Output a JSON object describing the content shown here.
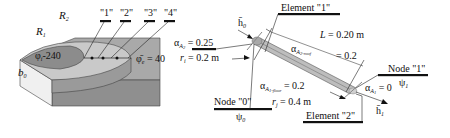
{
  "left_panel": {
    "labels": {
      "R1": "R",
      "R1_sub": "1",
      "R2": "R",
      "R2_sub": "2",
      "b0": "b",
      "b0_sub": "0",
      "phi_i": "φ",
      "phi_i_sub": "i",
      "phi_i_value": "-240",
      "phi_e": "φ̄",
      "phi_e_sub": "e",
      "phi_e_value": " = 40"
    },
    "points": [
      "\"1\"",
      "\"2\"",
      "\"3\"",
      "\"4\""
    ],
    "colors": {
      "slab_top": "#a8a8a8",
      "slab_side": "#8e8e8e",
      "disk_inner": "#8c8c8c",
      "disk_ring": "#c8c8c8",
      "face_light": "#efefef"
    }
  },
  "right_panel": {
    "element1": "Element \"1\"",
    "element2": "Element \"2\"",
    "node0": "Node \"0\"",
    "node0_psi": "ψ",
    "node0_psi_sub": "0",
    "node1": "Node \"1\"",
    "node1_psi": "ψ",
    "node1_psi_sub": "1",
    "h0": "h̄",
    "h0_sub": "0",
    "h1": "h̄",
    "h1_sub": "1",
    "alpha_A2": {
      "sym": "α",
      "sub": "A",
      "subsub": "2",
      "value": " = 0.25"
    },
    "r_i": {
      "sym": "r",
      "sub": "i",
      "value": " = 0.2 m"
    },
    "L": {
      "sym": "L",
      "value": " = 0.20 m"
    },
    "alpha_A2_roof": {
      "sym": "α",
      "sub": "A",
      "subsub": "2-roof",
      "value": "= 0.2"
    },
    "alpha_A1_floor": {
      "sym": "α",
      "sub": "A",
      "subsub": "1-floor",
      "value": " = 0.2"
    },
    "r_j": {
      "sym": "r",
      "sub": "j",
      "value": " = 0.4 m"
    },
    "alpha_A1": {
      "sym": "α",
      "sub": "A",
      "subsub": "1",
      "value": " = 0"
    }
  }
}
